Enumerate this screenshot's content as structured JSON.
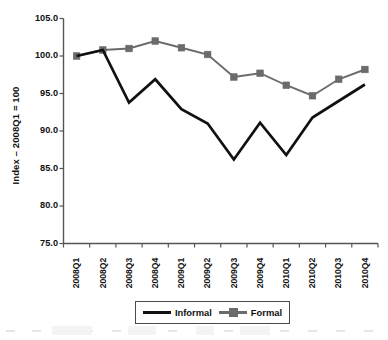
{
  "chart_data": {
    "type": "line",
    "title": "",
    "xlabel": "",
    "ylabel": "Index – 2008Q1 = 100",
    "categories": [
      "2008Q1",
      "2008Q2",
      "2008Q3",
      "2008Q4",
      "2009Q1",
      "2009Q2",
      "2009Q3",
      "2009Q4",
      "2010Q1",
      "2010Q2",
      "2010Q3",
      "2010Q4"
    ],
    "ylim": [
      75.0,
      105.0
    ],
    "yticks": [
      75.0,
      80.0,
      85.0,
      90.0,
      95.0,
      100.0,
      105.0
    ],
    "ytick_labels": [
      "75.0",
      "80.0",
      "85.0",
      "90.0",
      "95.0",
      "100.0",
      "105.0"
    ],
    "grid": false,
    "legend_position": "bottom",
    "series": [
      {
        "name": "Informal",
        "color": "#111111",
        "marker": "none",
        "values": [
          100.0,
          100.8,
          93.8,
          96.9,
          92.9,
          91.0,
          86.2,
          91.1,
          86.8,
          91.8,
          94.0,
          96.2
        ]
      },
      {
        "name": "Formal",
        "color": "#6b6b6b",
        "marker": "square",
        "values": [
          100.0,
          100.8,
          101.0,
          102.0,
          101.1,
          100.2,
          97.2,
          97.7,
          96.1,
          94.7,
          96.9,
          98.2
        ]
      }
    ]
  },
  "legend": {
    "entries": [
      {
        "label": "Informal"
      },
      {
        "label": "Formal"
      }
    ]
  },
  "colors": {
    "informal": "#111111",
    "formal": "#6b6b6b",
    "axis": "#555555",
    "text": "#111111",
    "background": "#ffffff"
  }
}
